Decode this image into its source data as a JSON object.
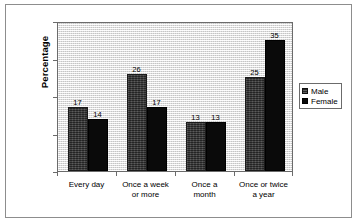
{
  "chart_data": {
    "type": "bar",
    "title": "",
    "xlabel": "",
    "ylabel": "Percentage",
    "ylim": [
      0,
      40
    ],
    "yticks": [
      0,
      10,
      20,
      30,
      40
    ],
    "ytick_labels": [
      "0",
      "10",
      "20",
      "30",
      "40"
    ],
    "grid": false,
    "legend_position": "right",
    "categories": [
      "Every day",
      "Once a week or more",
      "Once a month",
      "Once or twice a year"
    ],
    "category_lines": [
      {
        "line1": "Every day",
        "line2": ""
      },
      {
        "line1": "Once a week",
        "line2": "or more"
      },
      {
        "line1": "Once a",
        "line2": "month"
      },
      {
        "line1": "Once or twice",
        "line2": "a year"
      }
    ],
    "series": [
      {
        "name": "Male",
        "color": "#3a3a3a",
        "values": [
          17,
          26,
          13,
          25
        ]
      },
      {
        "name": "Female",
        "color": "#0a0a0a",
        "values": [
          14,
          17,
          13,
          35
        ]
      }
    ]
  },
  "legend": {
    "items": [
      {
        "label": "Male"
      },
      {
        "label": "Female"
      }
    ]
  }
}
